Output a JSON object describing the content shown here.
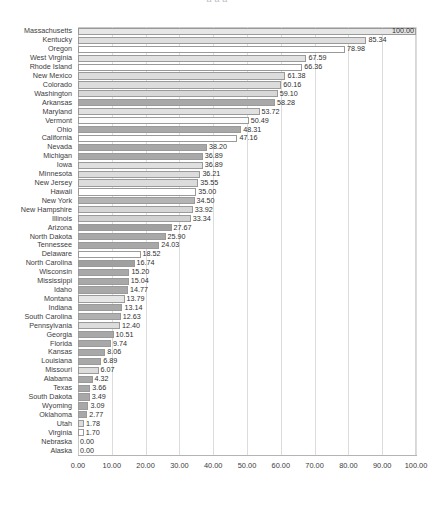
{
  "title": {
    "clipped_text": "a  a   a"
  },
  "chart_data": {
    "type": "bar",
    "orientation": "horizontal",
    "title": "",
    "xlabel": "",
    "ylabel": "",
    "xlim": [
      0,
      100
    ],
    "xticks": [
      "0.00",
      "10.00",
      "20.00",
      "30.00",
      "40.00",
      "50.00",
      "60.00",
      "70.00",
      "80.00",
      "90.00",
      "100.00"
    ],
    "xtick_values": [
      0,
      10,
      20,
      30,
      40,
      50,
      60,
      70,
      80,
      90,
      100
    ],
    "grid": true,
    "legend": "none",
    "value_label_format": "0.00",
    "categories": [
      "Massachusetts",
      "Kentucky",
      "Oregon",
      "West Virginia",
      "Rhode Island",
      "New Mexico",
      "Colorado",
      "Washington",
      "Arkansas",
      "Maryland",
      "Vermont",
      "Ohio",
      "California",
      "Nevada",
      "Michigan",
      "Iowa",
      "Minnesota",
      "New Jersey",
      "Hawaii",
      "New York",
      "New Hampshire",
      "Illinois",
      "Arizona",
      "North Dakota",
      "Tennessee",
      "Delaware",
      "North Carolina",
      "Wisconsin",
      "Mississippi",
      "Idaho",
      "Montana",
      "Indiana",
      "South Carolina",
      "Pennsylvania",
      "Georgia",
      "Florida",
      "Kansas",
      "Louisiana",
      "Missouri",
      "Alabama",
      "Texas",
      "South Dakota",
      "Wyoming",
      "Oklahoma",
      "Utah",
      "Virginia",
      "Nebraska",
      "Alaska"
    ],
    "values": [
      100.0,
      85.34,
      78.98,
      67.59,
      66.36,
      61.38,
      60.16,
      59.1,
      58.28,
      53.72,
      50.49,
      48.31,
      47.16,
      38.2,
      36.89,
      36.89,
      36.21,
      35.55,
      35.0,
      34.5,
      33.92,
      33.34,
      27.67,
      25.9,
      24.03,
      18.52,
      16.74,
      15.2,
      15.04,
      14.77,
      13.79,
      13.14,
      12.63,
      12.4,
      10.51,
      9.74,
      8.06,
      6.89,
      6.07,
      4.32,
      3.66,
      3.49,
      3.09,
      2.77,
      1.78,
      1.7,
      0.0,
      0.0
    ],
    "value_labels": [
      "100.00",
      "85.34",
      "78.98",
      "67.59",
      "66.36",
      "61.38",
      "60.16",
      "59.10",
      "58.28",
      "53.72",
      "50.49",
      "48.31",
      "47.16",
      "38.20",
      "36.89",
      "36.89",
      "36.21",
      "35.55",
      "35.00",
      "34.50",
      "33.92",
      "33.34",
      "27.67",
      "25.90",
      "24.03",
      "18.52",
      "16.74",
      "15.20",
      "15.04",
      "14.77",
      "13.79",
      "13.14",
      "12.63",
      "12.40",
      "10.51",
      "9.74",
      "8.06",
      "6.89",
      "6.07",
      "4.32",
      "3.66",
      "3.49",
      "3.09",
      "2.77",
      "1.78",
      "1.70",
      "0.00",
      "0.00"
    ],
    "bar_colors": [
      "#e6e6e6",
      "#dedede",
      "#ffffff",
      "#e2e2e2",
      "#ffffff",
      "#dcdcdc",
      "#dcdcdc",
      "#d8d8d8",
      "#a8a8a8",
      "#e0e0e0",
      "#fbfbfb",
      "#a8a8a8",
      "#ffffff",
      "#a8a8a8",
      "#a8a8a8",
      "#e0e0e0",
      "#dcdcdc",
      "#dcdcdc",
      "#ffffff",
      "#b4b4b4",
      "#d6d6d6",
      "#d2d2d2",
      "#a0a0a0",
      "#a8a8a8",
      "#a8a8a8",
      "#ffffff",
      "#a0a0a0",
      "#a8a8a8",
      "#a8a8a8",
      "#a8a8a8",
      "#e6e6e6",
      "#a8a8a8",
      "#b0b0b0",
      "#dcdcdc",
      "#a8a8a8",
      "#a8a8a8",
      "#a8a8a8",
      "#a8a8a8",
      "#dcdcdc",
      "#a8a8a8",
      "#a8a8a8",
      "#a8a8a8",
      "#a8a8a8",
      "#a8a8a8",
      "#dcdcdc",
      "#ffffff",
      "#ffffff",
      "#ffffff"
    ],
    "bar_border_color": "#9a9a9a",
    "grid_color": "#dcdcdc",
    "axis_color": "#b4b4b4",
    "text_color": "#3c3c3c",
    "background": "#ffffff"
  }
}
